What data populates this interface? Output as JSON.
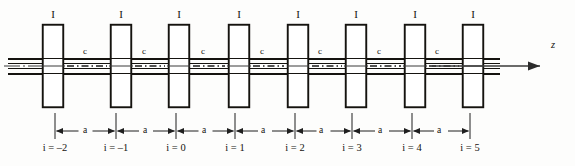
{
  "figure": {
    "kind": "periodic-cell-structure-diagram",
    "axis_label": "z",
    "cell_top_label": "I",
    "gap_label": "c",
    "period_label": "a",
    "cells": [
      {
        "index_label": "i = –2",
        "cell_x": 42,
        "tick_x": 55,
        "label_x": 55
      },
      {
        "index_label": "i = –1",
        "cell_x": 110,
        "tick_x": 116,
        "label_x": 116
      },
      {
        "index_label": "i = 0",
        "cell_x": 168,
        "tick_x": 176,
        "label_x": 176
      },
      {
        "index_label": "i = 1",
        "cell_x": 228,
        "tick_x": 235,
        "label_x": 235
      },
      {
        "index_label": "i = 2",
        "cell_x": 287,
        "tick_x": 295,
        "label_x": 295
      },
      {
        "index_label": "i = 3",
        "cell_x": 345,
        "tick_x": 352,
        "label_x": 352
      },
      {
        "index_label": "i = 4",
        "cell_x": 404,
        "tick_x": 412,
        "label_x": 412
      },
      {
        "index_label": "i = 5",
        "cell_x": 462,
        "tick_x": 470,
        "label_x": 470
      }
    ],
    "gaps": [
      {
        "label": "c",
        "x": 85
      },
      {
        "label": "c",
        "x": 144
      },
      {
        "label": "c",
        "x": 203
      },
      {
        "label": "c",
        "x": 262
      },
      {
        "label": "c",
        "x": 320
      },
      {
        "label": "c",
        "x": 379
      },
      {
        "label": "c",
        "x": 437
      }
    ],
    "periods": [
      {
        "label": "a",
        "x": 85
      },
      {
        "label": "a",
        "x": 145
      },
      {
        "label": "a",
        "x": 204
      },
      {
        "label": "a",
        "x": 263
      },
      {
        "label": "a",
        "x": 321
      },
      {
        "label": "a",
        "x": 380
      },
      {
        "label": "a",
        "x": 439
      }
    ],
    "colors": {
      "ink": "#15130f",
      "paper": "#fdfdfc",
      "axis": "#3a3a3a"
    }
  }
}
